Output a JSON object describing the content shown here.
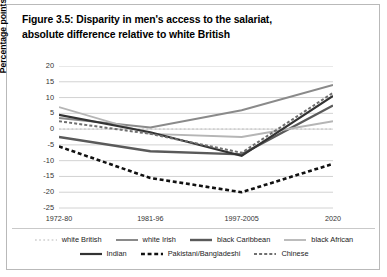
{
  "title": {
    "line1": "Figure 3.5: Disparity in men's access to the salariat,",
    "line2": "absolute difference relative to white British"
  },
  "chart_data": {
    "type": "line",
    "title": "Figure 3.5: Disparity in men's access to the salariat, absolute difference relative to white British",
    "xlabel": "",
    "ylabel": "Percentage points",
    "categories": [
      "1972-80",
      "1981-96",
      "1997-2005",
      "2020"
    ],
    "ylim": [
      -25,
      20
    ],
    "ytick_step": 5,
    "yticks": [
      "20",
      "15",
      "10",
      "5",
      "0",
      "-5",
      "-10",
      "-15",
      "-20",
      "-25"
    ],
    "grid": true,
    "legend_position": "bottom",
    "series": [
      {
        "name": "white British",
        "values": [
          0,
          0,
          0,
          0
        ],
        "style": "dotted",
        "color": "#d0d0d0",
        "width": 1.6
      },
      {
        "name": "white Irish",
        "values": [
          3.5,
          0.5,
          6.0,
          14.0
        ],
        "style": "solid",
        "color": "#8a8a8a",
        "width": 2.0
      },
      {
        "name": "black Caribbean",
        "values": [
          -2.5,
          -7.0,
          -8.0,
          7.5
        ],
        "style": "solid",
        "color": "#5a5a5a",
        "width": 2.4
      },
      {
        "name": "black African",
        "values": [
          7.0,
          -1.5,
          -2.5,
          2.5
        ],
        "style": "solid",
        "color": "#b5b5b5",
        "width": 1.8
      },
      {
        "name": "Indian",
        "values": [
          4.5,
          -1.0,
          -8.5,
          10.5
        ],
        "style": "solid",
        "color": "#333333",
        "width": 2.2
      },
      {
        "name": "Pakistani/Bangladeshi",
        "values": [
          -5.5,
          -15.5,
          -20.0,
          -11.0
        ],
        "style": "dashed",
        "color": "#111111",
        "width": 2.6
      },
      {
        "name": "Chinese",
        "values": [
          2.5,
          -1.5,
          -7.5,
          11.5
        ],
        "style": "dashed",
        "color": "#6f6f6f",
        "width": 2.0
      }
    ]
  }
}
